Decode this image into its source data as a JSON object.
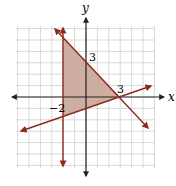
{
  "chart_data": {
    "type": "line",
    "title": "",
    "xlabel": "x",
    "ylabel": "y",
    "xlim": [
      -6,
      6
    ],
    "ylim": [
      -6,
      6
    ],
    "grid": true,
    "annotations": [
      "3",
      "3",
      "−2"
    ],
    "series": [
      {
        "name": "x = -2",
        "points": [
          [
            -2,
            5
          ],
          [
            -2,
            -6
          ]
        ]
      },
      {
        "name": "y = -x + 3",
        "points": [
          [
            -2.5,
            5.5
          ],
          [
            5.5,
            -2.5
          ]
        ]
      },
      {
        "name": "y = (x - 3)/3",
        "points": [
          [
            -5.5,
            -2.8
          ],
          [
            5.5,
            0.8
          ]
        ]
      }
    ],
    "shaded_region": {
      "vertices": [
        [
          -2,
          5
        ],
        [
          3,
          0
        ],
        [
          -2,
          -1.667
        ]
      ],
      "color": "#c8a89c"
    }
  },
  "labels": {
    "x_axis": "x",
    "y_axis": "y",
    "y_intercept": "3",
    "x_intercept": "3",
    "x_neg": "−2"
  },
  "colors": {
    "line": "#8b2a1e",
    "fill": "#c9a596",
    "grid": "#cfcfcf",
    "axis": "#222222"
  }
}
